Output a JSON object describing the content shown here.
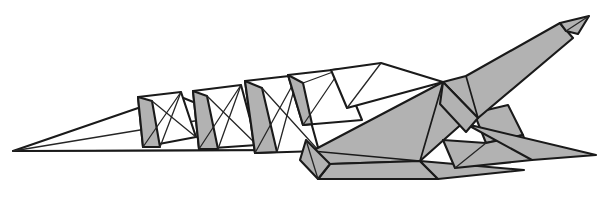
{
  "figure": {
    "style": "folded-paper line art",
    "canvas": {
      "width": 599,
      "height": 197
    },
    "colors": {
      "background": "#ffffff",
      "shaded_facet": "#b2b2b2",
      "unshaded_facet": "#ffffff",
      "outline": "#1a1a1a"
    },
    "baseline": {
      "from_x": 13,
      "to_x": 312,
      "y": 150
    },
    "parts": {
      "tail": "tail-wedge",
      "plates": "dorsal-plate-row",
      "body": "body-mass",
      "neck": "neck-taper",
      "head": "head-tip",
      "front_leg": "front-leg",
      "rear_leg": "rear-leg"
    },
    "plate_count": 4,
    "tail_tip": {
      "x": 13,
      "y": 151
    },
    "head_tip": {
      "x": 589,
      "y": 16
    },
    "shapes": {
      "tail_wedge": "13,151 312,150 176,95",
      "tail_underside": "13,151 312,150 150,139",
      "plate1_body": "138,96 181,92 196,136 144,145",
      "plate1_gray": "138,96 144,145 160,146 152,100",
      "plate2_body": "193,90 240,84 256,144 200,147",
      "plate2_gray": "193,90 200,147 218,148 207,95",
      "plate3_body": "246,80 297,74 318,152 256,153",
      "plate3_gray": "246,80 256,153 276,152 262,86",
      "plate4_body": "288,74 340,68 362,118 300,120",
      "plate4_gray": "288,74 300,120 318,119 303,80",
      "neck_sheet": "330,68 378,63 440,80 345,106",
      "body_top": "440,80 463,77 470,110 428,120",
      "body_main": "312,150 440,80 470,110 420,160 330,163",
      "body_mid": "330,163 420,160 436,178 318,178",
      "neck_upper": "440,80 463,77 556,24 571,36 476,116",
      "head": "556,24 589,16 578,33 566,31",
      "leg_front": "312,150 330,163 318,178 300,160",
      "leg_rear_upper": "470,110 506,104 520,133 484,140",
      "leg_rear_lower": "436,178 484,140 520,133 530,158",
      "spike_lower": "420,160 436,178 520,168",
      "spike_tail_rear": "470,140 530,158 596,154"
    }
  }
}
